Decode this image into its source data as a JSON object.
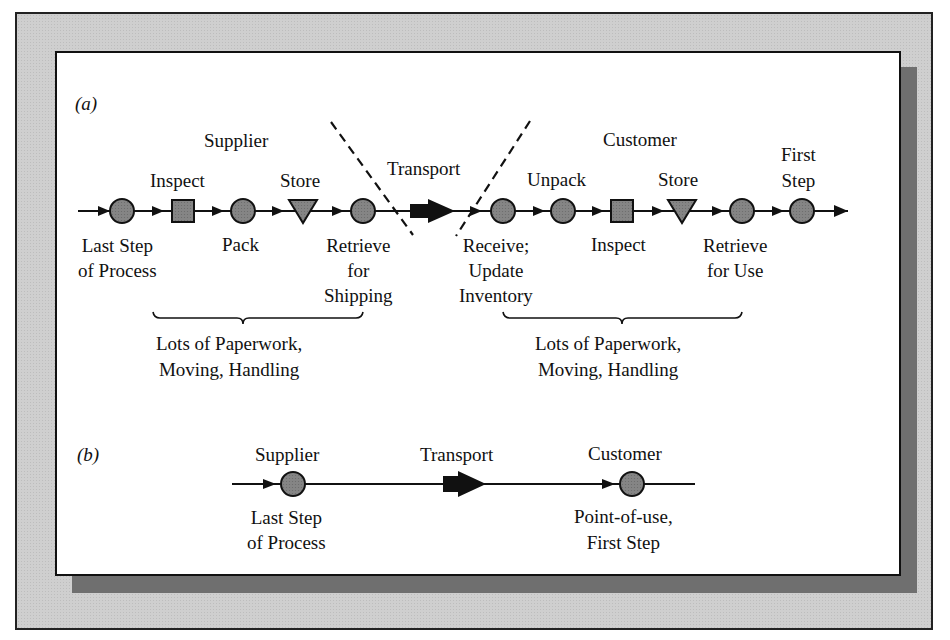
{
  "figure": {
    "panel_a": {
      "tag": "(a)",
      "supplier_heading": "Supplier",
      "customer_heading": "Customer",
      "transport_label": "Transport",
      "supplier_steps": [
        {
          "shape": "circle",
          "label_below": [
            "Last Step",
            "of Process"
          ]
        },
        {
          "shape": "square",
          "label_above": "Inspect"
        },
        {
          "shape": "circle",
          "label_below": [
            "Pack"
          ]
        },
        {
          "shape": "triangle",
          "label_above": "Store"
        },
        {
          "shape": "circle",
          "label_below": [
            "Retrieve",
            "for",
            "Shipping"
          ]
        }
      ],
      "customer_steps": [
        {
          "shape": "circle",
          "label_below": [
            "Receive;",
            "Update",
            "Inventory"
          ]
        },
        {
          "shape": "circle",
          "label_above": "Unpack"
        },
        {
          "shape": "square",
          "label_below": [
            "Inspect"
          ]
        },
        {
          "shape": "triangle",
          "label_above": "Store"
        },
        {
          "shape": "circle",
          "label_below": [
            "Retrieve",
            "for Use"
          ]
        },
        {
          "shape": "circle",
          "label_above": [
            "First",
            "Step"
          ]
        }
      ],
      "supplier_brace_note": [
        "Lots of Paperwork,",
        "Moving, Handling"
      ],
      "customer_brace_note": [
        "Lots of Paperwork,",
        "Moving, Handling"
      ]
    },
    "panel_b": {
      "tag": "(b)",
      "supplier_heading": "Supplier",
      "supplier_label": [
        "Last Step",
        "of Process"
      ],
      "transport_label": "Transport",
      "customer_heading": "Customer",
      "customer_label": [
        "Point-of-use,",
        "First Step"
      ]
    },
    "colors": {
      "node_fill": "#7d7d7d",
      "line": "#111111",
      "frame_bg": "#cfcfcf",
      "shadow": "#6f6f6f",
      "panel_bg": "#ffffff"
    }
  }
}
